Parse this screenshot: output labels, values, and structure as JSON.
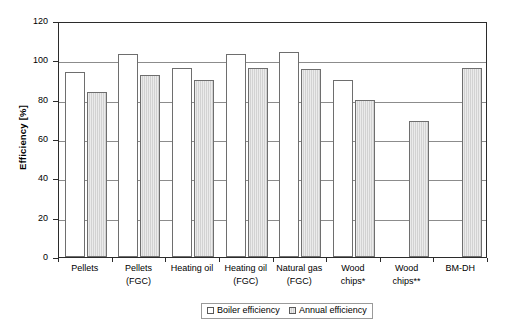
{
  "chart_data": {
    "type": "bar",
    "title": "",
    "xlabel": "",
    "ylabel": "Efficiency [%]",
    "ylim": [
      0,
      120
    ],
    "yticks": [
      0,
      20,
      40,
      60,
      80,
      100,
      120
    ],
    "grid": true,
    "legend_position": "bottom-center",
    "categories": [
      "Pellets",
      "Pellets (FGC)",
      "Heating oil",
      "Heating oil (FGC)",
      "Natural gas (FGC)",
      "Wood chips*",
      "Wood chips**",
      "BM-DH"
    ],
    "category_lines": [
      [
        "Pellets"
      ],
      [
        "Pellets",
        "(FGC)"
      ],
      [
        "Heating oil"
      ],
      [
        "Heating oil",
        "(FGC)"
      ],
      [
        "Natural gas",
        "(FGC)"
      ],
      [
        "Wood",
        "chips*"
      ],
      [
        "Wood",
        "chips**"
      ],
      [
        "BM-DH"
      ]
    ],
    "series": [
      {
        "name": "Boiler efficiency",
        "color": "#ffffff",
        "values": [
          94,
          103,
          96,
          103,
          104,
          90,
          null,
          null
        ]
      },
      {
        "name": "Annual efficiency",
        "color": "#d2d2d2",
        "values": [
          84,
          92.5,
          90,
          96,
          95.5,
          80,
          69,
          96
        ]
      }
    ]
  },
  "legend": {
    "items": [
      {
        "label": "Boiler efficiency",
        "swatch": "boiler"
      },
      {
        "label": "Annual efficiency",
        "swatch": "annual"
      }
    ]
  },
  "axis": {
    "y_title": "Efficiency [%]",
    "y_tick_labels": [
      "120",
      "100",
      "80",
      "60",
      "40",
      "20",
      "0"
    ]
  }
}
